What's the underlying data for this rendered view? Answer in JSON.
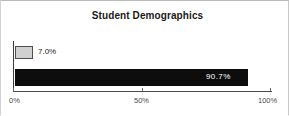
{
  "chart_data": {
    "type": "bar",
    "orientation": "horizontal",
    "title": "Student Demographics",
    "xlabel": "",
    "ylabel": "",
    "xlim": [
      0,
      100
    ],
    "grid": false,
    "legend": null,
    "categories": [
      "Series 1",
      "Series 2"
    ],
    "values": [
      7.0,
      90.7
    ],
    "data_labels": [
      "7.0%",
      "90.7%"
    ],
    "tick_labels": [
      "0%",
      "50%",
      "100%"
    ],
    "tick_values": [
      0,
      50,
      100
    ],
    "colors": {
      "bar_1_fill": "#d0d0d0",
      "bar_1_border": "#4d4d4d",
      "bar_2_fill": "#0d0d0d",
      "label_inside": "#ffffff",
      "label_outside": "#1a1a1a",
      "axis": "#4a4a4a",
      "background": "#ffffff"
    }
  }
}
